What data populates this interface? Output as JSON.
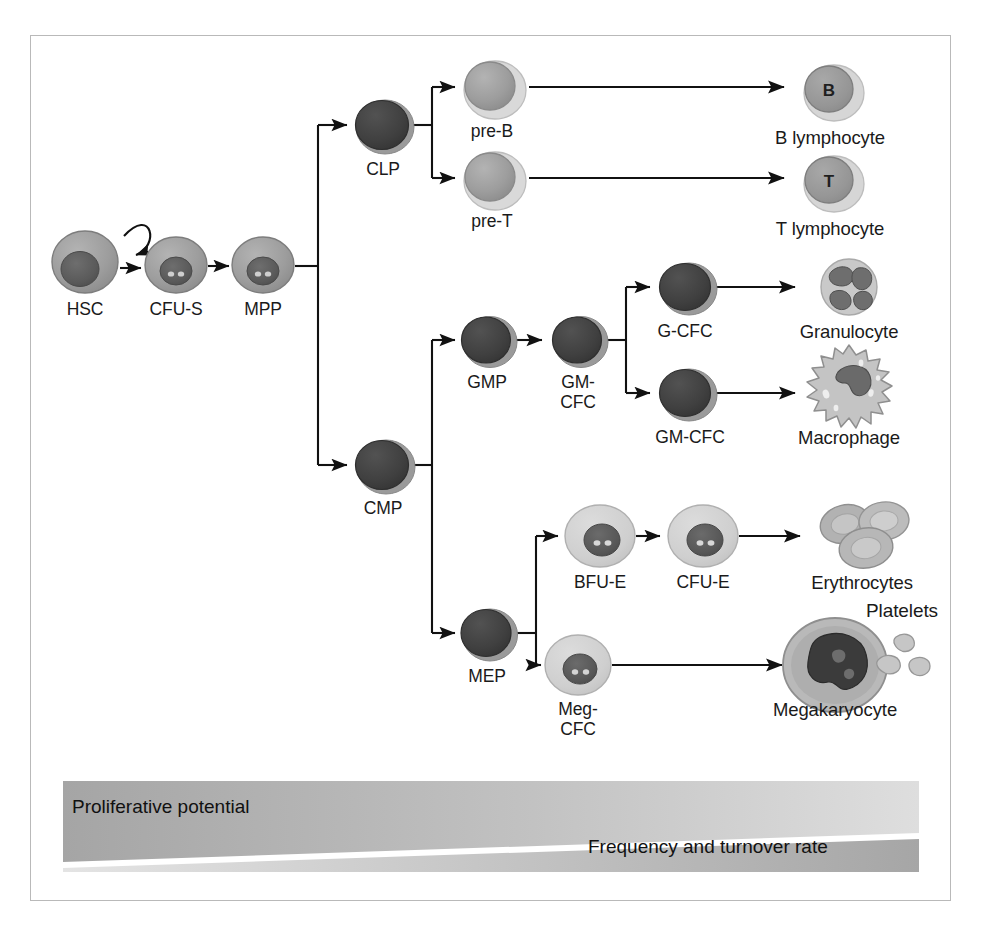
{
  "figure": {
    "frame_border_color": "#b9b9b9",
    "background": "#ffffff"
  },
  "palette": {
    "dark_cell_fill": "#3f3f3f",
    "dark_cell_rim": "#8c8c8c",
    "mid_cell_fill": "#9d9d9d",
    "mid_cell_nucleus": "#5e5e5e",
    "pale_cell_fill": "#d0d0d0",
    "pale_cell_rim": "#b5b5b5",
    "arrow_color": "#111111",
    "text_color": "#1a1a1a",
    "gradient_dark": "#a8a8a8",
    "gradient_light": "#e2e2e2"
  },
  "stem_row": [
    {
      "id": "hsc",
      "label": "HSC",
      "cx": 85,
      "cy": 262,
      "style": "mid",
      "r": 32,
      "self_renewal": true
    },
    {
      "id": "cfus",
      "label": "CFU-S",
      "cx": 176,
      "cy": 265,
      "style": "mid",
      "r": 30
    },
    {
      "id": "mpp",
      "label": "MPP",
      "cx": 263,
      "cy": 265,
      "style": "mid",
      "r": 30
    }
  ],
  "progenitors": [
    {
      "id": "clp",
      "label": "CLP",
      "cx": 383,
      "cy": 125,
      "style": "dark",
      "r": 28
    },
    {
      "id": "cmp",
      "label": "CMP",
      "cx": 383,
      "cy": 465,
      "style": "dark",
      "r": 28
    },
    {
      "id": "gmp",
      "label": "GMP",
      "cx": 487,
      "cy": 340,
      "style": "dark",
      "r": 26
    },
    {
      "id": "gmcfc",
      "label": "GM-\nCFC",
      "cx": 578,
      "cy": 340,
      "style": "dark",
      "r": 26
    },
    {
      "id": "mep",
      "label": "MEP",
      "cx": 487,
      "cy": 633,
      "style": "dark",
      "r": 26
    }
  ],
  "precursors": [
    {
      "id": "preb",
      "label": "pre-B",
      "cx": 492,
      "cy": 87,
      "style": "pale-big-nucleus",
      "r": 30
    },
    {
      "id": "pret",
      "label": "pre-T",
      "cx": 492,
      "cy": 178,
      "style": "pale-big-nucleus",
      "r": 30
    },
    {
      "id": "gcfc",
      "label": "G-CFC",
      "cx": 685,
      "cy": 287,
      "style": "dark",
      "r": 27
    },
    {
      "id": "gmcfc2",
      "label": "GM-CFC",
      "cx": 685,
      "cy": 393,
      "style": "dark",
      "r": 27
    },
    {
      "id": "bfue",
      "label": "BFU-E",
      "cx": 600,
      "cy": 536,
      "style": "pale",
      "r": 33
    },
    {
      "id": "cfue",
      "label": "CFU-E",
      "cx": 703,
      "cy": 536,
      "style": "pale",
      "r": 33
    },
    {
      "id": "megcfc",
      "label": "Meg-\nCFC",
      "cx": 578,
      "cy": 665,
      "style": "pale",
      "r": 31
    }
  ],
  "mature_cells": [
    {
      "id": "blymph",
      "label": "B lymphocyte",
      "cx": 830,
      "cy": 90,
      "glyph": "B",
      "type": "lymphocyte"
    },
    {
      "id": "tlymph",
      "label": "T lymphocyte",
      "cx": 830,
      "cy": 181,
      "glyph": "T",
      "type": "lymphocyte"
    },
    {
      "id": "granulo",
      "label": "Granulocyte",
      "cx": 849,
      "cy": 287,
      "type": "granulocyte"
    },
    {
      "id": "macro",
      "label": "Macrophage",
      "cx": 849,
      "cy": 398,
      "type": "macrophage"
    },
    {
      "id": "eryth",
      "label": "Erythrocytes",
      "cx": 862,
      "cy": 536,
      "type": "erythrocytes"
    },
    {
      "id": "megakar",
      "label": "Megakaryocyte",
      "cx": 835,
      "cy": 665,
      "type": "megakaryocyte"
    },
    {
      "id": "platelets",
      "label": "Platelets",
      "cx": 902,
      "cy": 617,
      "type": "platelets"
    }
  ],
  "gradient_bar": {
    "left_label": "Proliferative potential",
    "right_label": "Frequency and turnover rate",
    "description": "Two wedges split by a white diagonal; proliferative potential decreases left to right, frequency and turnover rate increases left to right."
  }
}
